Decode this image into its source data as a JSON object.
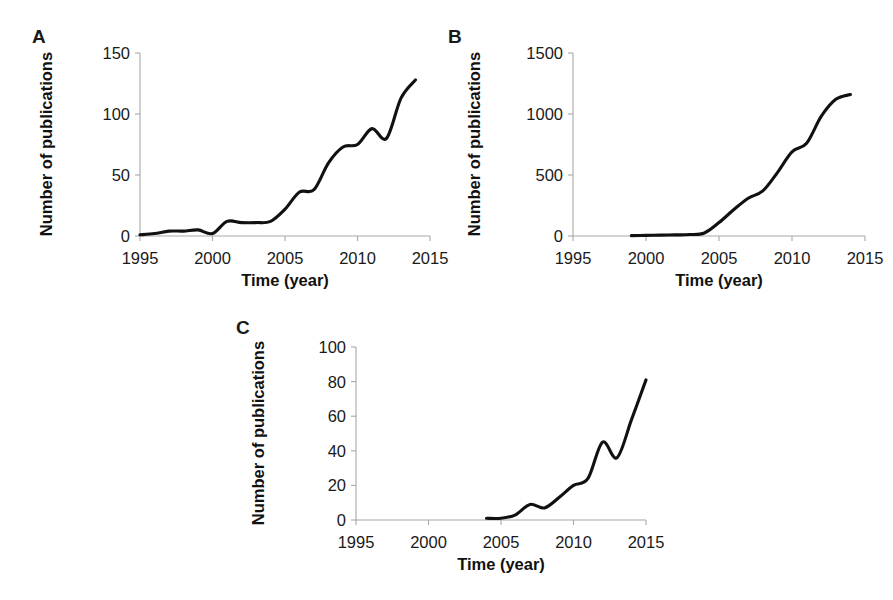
{
  "figure": {
    "panels": [
      "A",
      "B",
      "C"
    ],
    "line_color": "#111111",
    "axis_color": "#a8a8a8",
    "text_color": "#1a1a1a"
  },
  "chart_data": [
    {
      "panel": "A",
      "type": "line",
      "title": "",
      "xlabel": "Time (year)",
      "ylabel": "Number of publications",
      "xlim": [
        1995,
        2015
      ],
      "ylim": [
        0,
        150
      ],
      "xticks": [
        1995,
        2000,
        2005,
        2010,
        2015
      ],
      "yticks": [
        0,
        50,
        100,
        150
      ],
      "xtick_labels": [
        "1995",
        "2000",
        "2005",
        "2010",
        "2015"
      ],
      "ytick_labels": [
        "0",
        "50",
        "100",
        "150"
      ],
      "grid": false,
      "legend": false,
      "x": [
        1995,
        1996,
        1997,
        1998,
        1999,
        2000,
        2001,
        2002,
        2003,
        2004,
        2005,
        2006,
        2007,
        2008,
        2009,
        2010,
        2011,
        2012,
        2013,
        2014
      ],
      "values": [
        1,
        2,
        4,
        4,
        5,
        2,
        12,
        11,
        11,
        12,
        22,
        36,
        38,
        60,
        73,
        75,
        88,
        80,
        113,
        128
      ]
    },
    {
      "panel": "B",
      "type": "line",
      "title": "",
      "xlabel": "Time (year)",
      "ylabel": "Number of publications",
      "xlim": [
        1995,
        2015
      ],
      "ylim": [
        0,
        1500
      ],
      "xticks": [
        1995,
        2000,
        2005,
        2010,
        2015
      ],
      "yticks": [
        0,
        500,
        1000,
        1500
      ],
      "xtick_labels": [
        "1995",
        "2000",
        "2005",
        "2010",
        "2015"
      ],
      "ytick_labels": [
        "0",
        "500",
        "1000",
        "1500"
      ],
      "grid": false,
      "legend": false,
      "x": [
        1999,
        2000,
        2001,
        2002,
        2003,
        2004,
        2005,
        2006,
        2007,
        2008,
        2009,
        2010,
        2011,
        2012,
        2013,
        2014
      ],
      "values": [
        3,
        5,
        7,
        9,
        12,
        25,
        110,
        215,
        310,
        370,
        520,
        690,
        760,
        980,
        1120,
        1160
      ]
    },
    {
      "panel": "C",
      "type": "line",
      "title": "",
      "xlabel": "Time (year)",
      "ylabel": "Number of publications",
      "xlim": [
        1995,
        2015
      ],
      "ylim": [
        0,
        100
      ],
      "xticks": [
        1995,
        2000,
        2005,
        2010,
        2015
      ],
      "yticks": [
        0,
        20,
        40,
        60,
        80,
        100
      ],
      "xtick_labels": [
        "1995",
        "2000",
        "2005",
        "2010",
        "2015"
      ],
      "ytick_labels": [
        "0",
        "20",
        "40",
        "60",
        "80",
        "100"
      ],
      "grid": false,
      "legend": false,
      "x": [
        2004,
        2005,
        2006,
        2007,
        2008,
        2009,
        2010,
        2011,
        2012,
        2013,
        2014,
        2015
      ],
      "values": [
        1,
        1,
        3,
        9,
        7,
        13,
        20,
        24,
        45,
        36,
        58,
        81
      ]
    }
  ],
  "panel_a": {
    "label": "A"
  },
  "panel_b": {
    "label": "B"
  },
  "panel_c": {
    "label": "C"
  }
}
